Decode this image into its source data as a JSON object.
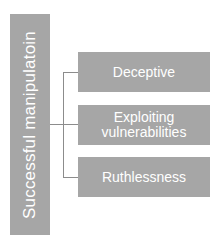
{
  "diagram": {
    "root": {
      "label": "Successful manipulatoin"
    },
    "children": [
      {
        "label": "Deceptive"
      },
      {
        "label": "Exploiting vulnerabilities"
      },
      {
        "label": "Ruthlessness"
      }
    ],
    "colors": {
      "box": "#a6a6a6",
      "text": "#ffffff",
      "connector": "#8c8c8c"
    }
  }
}
